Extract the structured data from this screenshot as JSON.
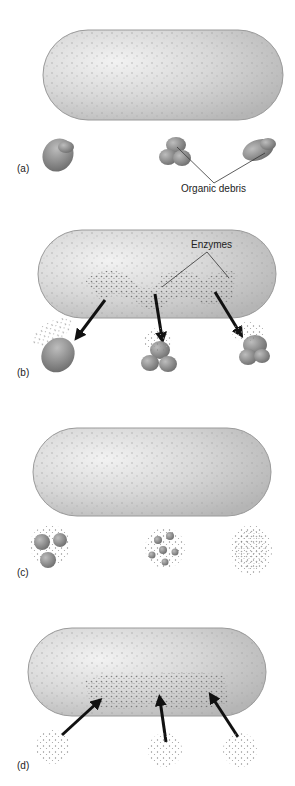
{
  "diagram": {
    "panels": [
      {
        "id": "a",
        "label": "(a)",
        "callout": "Organic debris",
        "description": "Bacterial cell next to three particles of organic debris"
      },
      {
        "id": "b",
        "label": "(b)",
        "callout": "Enzymes",
        "description": "Cell secretes enzymes onto debris particles"
      },
      {
        "id": "c",
        "label": "(c)",
        "description": "Debris broken down into smaller molecules"
      },
      {
        "id": "d",
        "label": "(d)",
        "description": "Small molecules absorbed back into the cell"
      }
    ],
    "colors": {
      "cell_fill": "#d9d9d9",
      "cell_edge": "#9a9a9a",
      "debris": "#8a8a8a",
      "enzyme_dots": "#777777",
      "arrow": "#111111",
      "leader_line": "#333333"
    }
  }
}
